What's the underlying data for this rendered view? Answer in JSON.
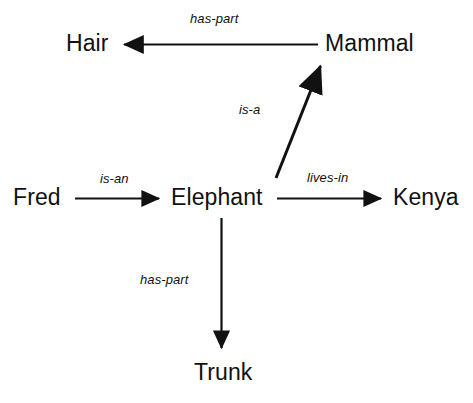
{
  "diagram": {
    "background_color": "#ffffff",
    "stroke_color": "#111111",
    "nodes": [
      {
        "id": "hair",
        "label": "Hair",
        "x": 66,
        "y": 44
      },
      {
        "id": "mammal",
        "label": "Mammal",
        "x": 325,
        "y": 44
      },
      {
        "id": "fred",
        "label": "Fred",
        "x": 13,
        "y": 198
      },
      {
        "id": "elephant",
        "label": "Elephant",
        "x": 171,
        "y": 198
      },
      {
        "id": "kenya",
        "label": "Kenya",
        "x": 393,
        "y": 198
      },
      {
        "id": "trunk",
        "label": "Trunk",
        "x": 194,
        "y": 373
      }
    ],
    "edges": [
      {
        "id": "mammal-haspart-hair",
        "label": "has-part",
        "source": "mammal",
        "target": "hair",
        "direction": "left",
        "label_x": 222,
        "label_y": 20
      },
      {
        "id": "elephant-isa-mammal",
        "label": "is-a",
        "source": "elephant",
        "target": "mammal",
        "direction": "up-right",
        "label_x": 255,
        "label_y": 110
      },
      {
        "id": "fred-isan-elephant",
        "label": "is-an",
        "source": "fred",
        "target": "elephant",
        "direction": "right",
        "label_x": 119,
        "label_y": 179
      },
      {
        "id": "elephant-livesin-kenya",
        "label": "lives-in",
        "source": "elephant",
        "target": "kenya",
        "direction": "right",
        "label_x": 335,
        "label_y": 178
      },
      {
        "id": "elephant-haspart-trunk",
        "label": "has-part",
        "source": "elephant",
        "target": "trunk",
        "direction": "down",
        "label_x": 173,
        "label_y": 281
      }
    ]
  }
}
